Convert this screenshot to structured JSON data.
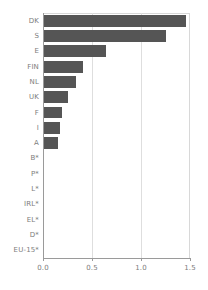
{
  "chart_data": {
    "type": "bar",
    "orientation": "horizontal",
    "title": "",
    "subtitle": "",
    "xlabel": "",
    "ylabel": "",
    "categories": [
      "DK",
      "S",
      "E",
      "FIN",
      "NL",
      "UK",
      "F",
      "I",
      "A",
      "B*",
      "P*",
      "L*",
      "IRL*",
      "EL*",
      "D*",
      "EU-15*"
    ],
    "values": [
      1.46,
      1.26,
      0.64,
      0.41,
      0.34,
      0.25,
      0.19,
      0.17,
      0.15,
      0,
      0,
      0,
      0,
      0,
      0,
      0
    ],
    "xlim": [
      0.0,
      1.5
    ],
    "xticks": [
      0.0,
      0.5,
      1.0,
      1.5
    ],
    "xtick_labels": [
      "0.0",
      "0.5",
      "1.0",
      "1.5"
    ],
    "grid": "vertical",
    "legend": "none",
    "bar_color": "#555555",
    "gridline_color": "#dedede",
    "axis_color": "#9a9a9a",
    "label_color": "#7c7c7c",
    "background_color": "#ffffff"
  }
}
